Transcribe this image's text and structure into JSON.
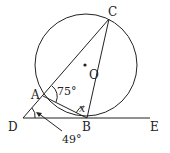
{
  "figure": {
    "type": "geometry",
    "points": {
      "A": {
        "label": "A",
        "x": 43,
        "y": 96
      },
      "B": {
        "label": "B",
        "x": 87,
        "y": 118
      },
      "C": {
        "label": "C",
        "x": 109,
        "y": 19
      },
      "D": {
        "label": "D",
        "x": 23,
        "y": 118
      },
      "E": {
        "label": "E",
        "x": 150,
        "y": 118
      },
      "O": {
        "label": "O",
        "x": 85,
        "y": 65
      }
    },
    "circle": {
      "center": "O",
      "cx": 86,
      "cy": 65,
      "r": 51
    },
    "angles": {
      "CAB": {
        "label": "75°"
      },
      "ABC": {
        "label": "x"
      },
      "ADB": {
        "label": "49°"
      }
    },
    "colors": {
      "stroke": "#222222",
      "background": "#ffffff"
    }
  }
}
